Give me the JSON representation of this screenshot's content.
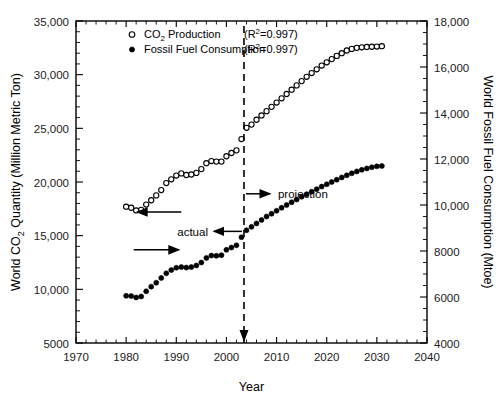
{
  "figure": {
    "background_color": "#ffffff",
    "ink_color": "#000000"
  },
  "chart_data": {
    "type": "scatter",
    "title": "",
    "xlabel": "Year",
    "ylabel": "World CO2 Quantity (Million Metric Ton)",
    "y2label": "World Fossil Fuel Consumption (Mtoe)",
    "xlim": [
      1970,
      2040
    ],
    "ylim": [
      5000,
      35000
    ],
    "y2lim": [
      4000,
      18000
    ],
    "xticks": [
      1970,
      1980,
      1990,
      2000,
      2010,
      2020,
      2030,
      2040
    ],
    "xtick_labels": [
      "1970",
      "1980",
      "1990",
      "2000",
      "2010",
      "2020",
      "2030",
      "2040"
    ],
    "yticks": [
      5000,
      10000,
      15000,
      20000,
      25000,
      30000,
      35000
    ],
    "ytick_labels": [
      "5000",
      "10,000",
      "15,000",
      "20,000",
      "25,000",
      "30,000",
      "35,000"
    ],
    "y2ticks": [
      4000,
      6000,
      8000,
      10000,
      12000,
      14000,
      16000,
      18000
    ],
    "y2tick_labels": [
      "4000",
      "6000",
      "8000",
      "10,000",
      "12,000",
      "14,000",
      "16,000",
      "18,000"
    ],
    "grid": false,
    "minor_ticks": true,
    "legend_position": "top-left-inside",
    "legend": [
      {
        "label": "CO2 Production",
        "stat": "(R2=0.997)",
        "marker": "open-square-circle",
        "axis": "left"
      },
      {
        "label": "Fossil Fuel Consumption",
        "stat": "(R2=0.997)",
        "marker": "filled-circle",
        "axis": "right"
      }
    ],
    "annotations": [
      {
        "name": "actual",
        "text": "actual",
        "x": 1995.5,
        "y": 15400,
        "arrow": "left-to-right-pointing-left"
      },
      {
        "name": "projection",
        "text": "projection",
        "x": 2008.5,
        "y": 18900,
        "arrow": "pointing-right"
      },
      {
        "name": "projection-divider",
        "text": "",
        "x": 2003.5,
        "type": "vertical-dashed-line"
      },
      {
        "name": "left-axis-pointer",
        "text": "",
        "x": 1983.5,
        "y": 17200,
        "type": "arrow-left"
      },
      {
        "name": "right-axis-pointer",
        "text": "",
        "x": 1984.5,
        "y": 8050,
        "type": "arrow-right"
      }
    ],
    "series": [
      {
        "name": "CO2 Production",
        "axis": "left",
        "marker": "open",
        "unit": "Million Metric Ton",
        "x": [
          1980,
          1981,
          1982,
          1983,
          1984,
          1985,
          1986,
          1987,
          1988,
          1989,
          1990,
          1991,
          1992,
          1993,
          1994,
          1995,
          1996,
          1997,
          1998,
          1999,
          2000,
          2001,
          2002,
          2003,
          2004,
          2005,
          2006,
          2007,
          2008,
          2009,
          2010,
          2011,
          2012,
          2013,
          2014,
          2015,
          2016,
          2017,
          2018,
          2019,
          2020,
          2021,
          2022,
          2023,
          2024,
          2025,
          2026,
          2027,
          2028,
          2029,
          2030,
          2031
        ],
        "y": [
          17700,
          17600,
          17350,
          17400,
          17900,
          18300,
          18750,
          19250,
          19900,
          20250,
          20600,
          20800,
          20650,
          20700,
          20850,
          21200,
          21750,
          21950,
          21900,
          21900,
          22400,
          22700,
          22950,
          24000,
          25050,
          25350,
          25800,
          26200,
          26600,
          27000,
          27400,
          27800,
          28200,
          28600,
          29000,
          29400,
          29800,
          30150,
          30500,
          30850,
          31150,
          31450,
          31750,
          32000,
          32250,
          32400,
          32500,
          32550,
          32580,
          32600,
          32620,
          32650
        ]
      },
      {
        "name": "Fossil Fuel Consumption",
        "axis": "right",
        "marker": "filled",
        "unit": "Mtoe",
        "x": [
          1980,
          1981,
          1982,
          1983,
          1984,
          1985,
          1986,
          1987,
          1988,
          1989,
          1990,
          1991,
          1992,
          1993,
          1994,
          1995,
          1996,
          1997,
          1998,
          1999,
          2000,
          2001,
          2002,
          2003,
          2004,
          2005,
          2006,
          2007,
          2008,
          2009,
          2010,
          2011,
          2012,
          2013,
          2014,
          2015,
          2016,
          2017,
          2018,
          2019,
          2020,
          2021,
          2022,
          2023,
          2024,
          2025,
          2026,
          2027,
          2028,
          2029,
          2030,
          2031
        ],
        "y": [
          6050,
          6040,
          5980,
          6020,
          6250,
          6450,
          6620,
          6830,
          7030,
          7170,
          7270,
          7300,
          7280,
          7300,
          7370,
          7500,
          7700,
          7800,
          7790,
          7820,
          8050,
          8150,
          8250,
          8600,
          8900,
          9050,
          9200,
          9350,
          9500,
          9620,
          9750,
          9880,
          10000,
          10120,
          10240,
          10360,
          10470,
          10580,
          10690,
          10800,
          10900,
          11000,
          11100,
          11200,
          11290,
          11380,
          11460,
          11530,
          11590,
          11640,
          11680,
          11700
        ]
      }
    ]
  }
}
